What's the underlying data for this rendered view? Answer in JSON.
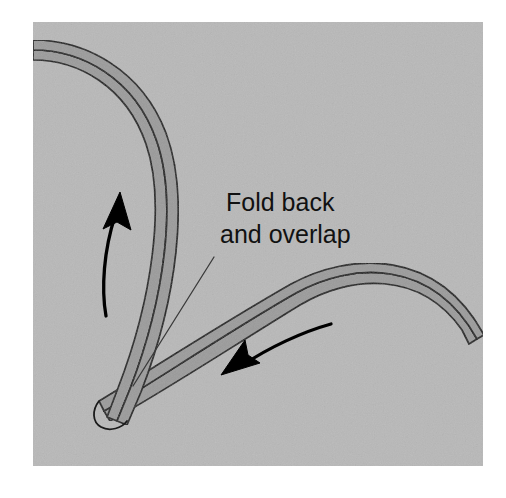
{
  "figure": {
    "panel": {
      "background_color": "#b8b8b8",
      "x": 33,
      "y": 22,
      "width": 450,
      "height": 444
    },
    "page_background_color": "#ffffff",
    "band_fill_color": "#9b9b9b",
    "band_stroke_color": "#1a1a1a",
    "arrow_color": "#000000",
    "leader_color": "#3a3a3a"
  },
  "annotations": {
    "caption_line_1": "Fold back",
    "caption_line_2": "and overlap",
    "caption_x": 226,
    "caption_line_1_y": 211,
    "caption_line_2_y": 243
  },
  "elements": {
    "upper_band_name": "folded-band-upper",
    "lower_band_name": "folded-band-lower",
    "arrow_up_name": "direction-arrow-up",
    "arrow_left_name": "direction-arrow-left",
    "leader_name": "caption-leader-line"
  }
}
